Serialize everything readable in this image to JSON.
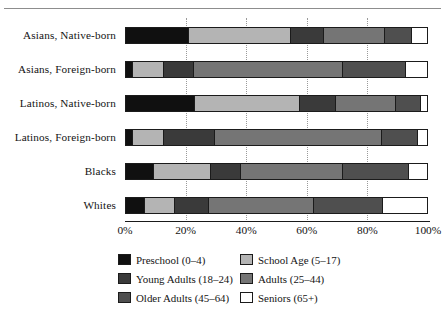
{
  "chart_data": {
    "type": "bar",
    "orientation": "horizontal",
    "stacked": true,
    "normalized": true,
    "title": "",
    "xlabel": "",
    "ylabel": "",
    "xlim": [
      0,
      100
    ],
    "xticks": [
      "0%",
      "20%",
      "40%",
      "60%",
      "80%",
      "100%"
    ],
    "xtick_values": [
      0,
      20,
      40,
      60,
      80,
      100
    ],
    "grid": "vertical-dotted",
    "legend_position": "bottom",
    "categories": [
      "Asians, Native-born",
      "Asians, Foreign-born",
      "Latinos, Native-born",
      "Latinos, Foreign-born",
      "Blacks",
      "Whites"
    ],
    "series": [
      {
        "name": "Preschool (0-4)",
        "color": "#101010",
        "values": [
          21,
          2,
          23,
          2,
          9,
          6
        ]
      },
      {
        "name": "School Age (5-17)",
        "color": "#b4b4b4",
        "values": [
          34,
          10,
          35,
          10,
          19,
          10
        ]
      },
      {
        "name": "Young Adults (18-24)",
        "color": "#3a3a3a",
        "values": [
          11,
          10,
          12,
          17,
          10,
          11
        ]
      },
      {
        "name": "Adults (25-44)",
        "color": "#757575",
        "values": [
          20,
          50,
          20,
          56,
          34,
          35
        ]
      },
      {
        "name": "Older Adults (45-64)",
        "color": "#4f4f4f",
        "values": [
          9,
          21,
          8,
          12,
          22,
          23
        ]
      },
      {
        "name": "Seniors (65+)",
        "color": "#ffffff",
        "values": [
          5,
          7,
          2,
          3,
          6,
          15
        ]
      }
    ]
  },
  "legend": {
    "items": [
      {
        "label": "Preschool (0–4)",
        "swatch": "#101010",
        "name": "preschool"
      },
      {
        "label": "School Age (5–17)",
        "swatch": "#b4b4b4",
        "name": "school-age"
      },
      {
        "label": "Young Adults (18–24)",
        "swatch": "#3a3a3a",
        "name": "young-adults"
      },
      {
        "label": "Adults (25–44)",
        "swatch": "#757575",
        "name": "adults"
      },
      {
        "label": "Older Adults (45–64)",
        "swatch": "#4f4f4f",
        "name": "older-adults"
      },
      {
        "label": "Seniors (65+)",
        "swatch": "#ffffff",
        "name": "seniors"
      }
    ]
  },
  "colors": {
    "axis": "#1a1a1a",
    "grid": "#9a9a9a",
    "text": "#131313",
    "rule": "#8d8d8d"
  }
}
